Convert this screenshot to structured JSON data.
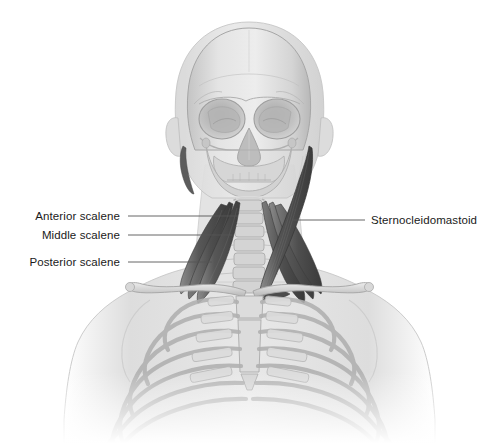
{
  "figure": {
    "background_color": "#ffffff",
    "width": 499,
    "height": 443
  },
  "palette": {
    "muscle_dark": "#4a4a4a",
    "muscle_mid": "#6e6e6e",
    "muscle_light": "#8d8d8d",
    "bone_light": "#e2e2e2",
    "bone_mid": "#c9c9c9",
    "bone_shadow": "#a9a9a9",
    "body_silhouette": "#dcdcdc",
    "body_silhouette_edge": "#bcbcbc",
    "leader_line": "#555555",
    "label_text": "#1a1a1a"
  },
  "labels": {
    "left": [
      {
        "id": "anterior-scalene",
        "text": "Anterior scalene",
        "text_x": 120,
        "text_y": 216,
        "line_x1": 128,
        "line_x2": 238,
        "line_y": 216
      },
      {
        "id": "middle-scalene",
        "text": "Middle scalene",
        "text_x": 120,
        "text_y": 235,
        "line_x1": 128,
        "line_x2": 232,
        "line_y": 235
      },
      {
        "id": "posterior-scalene",
        "text": "Posterior scalene",
        "text_x": 120,
        "text_y": 262,
        "line_x1": 128,
        "line_x2": 212,
        "line_y": 262
      }
    ],
    "right": [
      {
        "id": "sternocleidomastoid",
        "text": "Sternocleidomastoid",
        "text_x": 371,
        "text_y": 220,
        "line_x1": 293,
        "line_x2": 365,
        "line_y": 220
      }
    ]
  },
  "anatomy": {
    "structures": [
      {
        "name": "head-silhouette",
        "kind": "soft-tissue"
      },
      {
        "name": "cranium",
        "kind": "bone"
      },
      {
        "name": "orbit-left",
        "kind": "bone"
      },
      {
        "name": "orbit-right",
        "kind": "bone"
      },
      {
        "name": "nasal-aperture",
        "kind": "bone"
      },
      {
        "name": "maxilla",
        "kind": "bone"
      },
      {
        "name": "mandible",
        "kind": "bone"
      },
      {
        "name": "cervical-spine",
        "kind": "bone"
      },
      {
        "name": "clavicle-left",
        "kind": "bone"
      },
      {
        "name": "clavicle-right",
        "kind": "bone"
      },
      {
        "name": "sternum",
        "kind": "bone"
      },
      {
        "name": "rib-cage",
        "kind": "bone",
        "rib_pairs": 7
      },
      {
        "name": "scapula-left",
        "kind": "bone"
      },
      {
        "name": "scapula-right",
        "kind": "bone"
      },
      {
        "name": "anterior-scalene-muscle",
        "kind": "muscle",
        "side": "left"
      },
      {
        "name": "middle-scalene-muscle",
        "kind": "muscle",
        "side": "left"
      },
      {
        "name": "posterior-scalene-muscle",
        "kind": "muscle",
        "side": "left"
      },
      {
        "name": "anterior-scalene-muscle",
        "kind": "muscle",
        "side": "right"
      },
      {
        "name": "middle-scalene-muscle",
        "kind": "muscle",
        "side": "right"
      },
      {
        "name": "posterior-scalene-muscle",
        "kind": "muscle",
        "side": "right"
      },
      {
        "name": "sternocleidomastoid-muscle",
        "kind": "muscle",
        "side": "right"
      },
      {
        "name": "torso-silhouette",
        "kind": "soft-tissue"
      }
    ]
  }
}
